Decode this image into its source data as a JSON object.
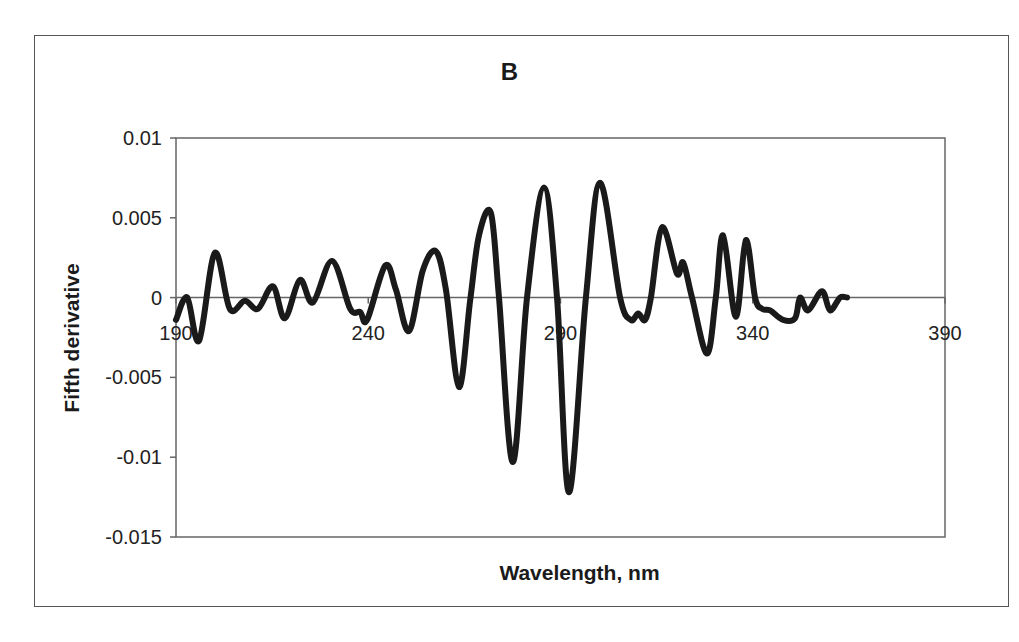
{
  "chart_data": {
    "type": "line",
    "title": "B",
    "xlabel": "Wavelength, nm",
    "ylabel": "Fifth derivative",
    "xlim": [
      190,
      390
    ],
    "ylim": [
      -0.015,
      0.01
    ],
    "xticks": [
      190,
      240,
      290,
      340,
      390
    ],
    "xtick_labels": [
      "190",
      "240",
      "290",
      "340",
      "390"
    ],
    "yticks": [
      0.01,
      0.005,
      0,
      -0.005,
      -0.01,
      -0.015
    ],
    "ytick_labels": [
      "0.01",
      "0.005",
      "0",
      "-0.005",
      "-0.01",
      "-0.015"
    ],
    "grid": false,
    "legend": null,
    "x_axis_crosses_at_y": 0,
    "series": [
      {
        "name": "Fifth derivative",
        "color": "#1a1a1a",
        "x": [
          190,
          192.9,
          196.0,
          200.1,
          204.0,
          207.9,
          211.3,
          215.2,
          218.3,
          222.2,
          225.6,
          230.6,
          235.3,
          237.9,
          239.7,
          244.4,
          247.2,
          250.6,
          254.2,
          257.6,
          260.2,
          263.6,
          266.5,
          268.8,
          271.9,
          274.0,
          277.6,
          281.3,
          285.7,
          289.1,
          292.2,
          296.6,
          300.3,
          305.5,
          308.3,
          310.2,
          312.0,
          313.5,
          316.4,
          320.3,
          321.9,
          324.2,
          328.1,
          330.4,
          332.3,
          335.6,
          338.2,
          340.6,
          342.4,
          344.5,
          347.9,
          351.0,
          352.3,
          354.4,
          358.0,
          360.1,
          362.7,
          364.5
        ],
        "y": [
          -0.0014,
          0.0,
          -0.0027,
          0.0028,
          -0.0007,
          -0.0002,
          -0.0007,
          0.0007,
          -0.0013,
          0.0011,
          -0.0003,
          0.0023,
          -0.0007,
          -0.0009,
          -0.0014,
          0.002,
          0.0005,
          -0.0021,
          0.0017,
          0.0029,
          0.0005,
          -0.0056,
          -0.0002,
          0.0039,
          0.0053,
          0.0,
          -0.0103,
          0.0,
          0.0069,
          0.0,
          -0.0122,
          0.0,
          0.0072,
          0.0,
          -0.0014,
          -0.001,
          -0.0014,
          0.0,
          0.0044,
          0.0015,
          0.0022,
          0.0,
          -0.0035,
          0.0,
          0.0039,
          -0.0012,
          0.0036,
          0.0,
          -0.0007,
          -0.0008,
          -0.0014,
          -0.0013,
          0.0,
          -0.0008,
          0.0004,
          -0.0008,
          0.0,
          0.0
        ]
      }
    ]
  },
  "colors": {
    "line": "#1a1a1a",
    "axis": "#666666",
    "frame": "#555555",
    "background": "#ffffff"
  }
}
